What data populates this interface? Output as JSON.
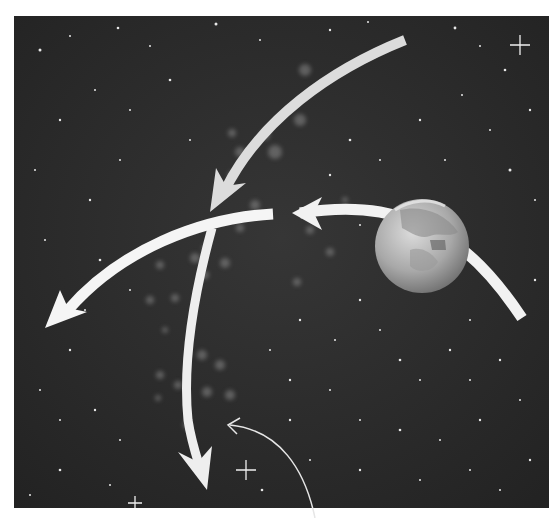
{
  "figure": {
    "colors": {
      "background_page": "#ffffff",
      "space": "#2a2a2a",
      "arrow": "#f2f2f2",
      "earth_light": "#cfcfcf",
      "earth_dark": "#7a7a7a",
      "callout_line": "#e6e6e6"
    },
    "panel": {
      "x": 14,
      "y": 16,
      "width": 535,
      "height": 492
    },
    "earth": {
      "cx": 422,
      "cy": 246,
      "r": 47
    },
    "arrows": [
      {
        "name": "earth-arrow",
        "from": [
          522,
          318
        ],
        "to": [
          292,
          213
        ]
      },
      {
        "name": "top-arrow",
        "from": [
          405,
          40
        ],
        "to": [
          210,
          210
        ]
      },
      {
        "name": "left-arrow",
        "from": [
          273,
          214
        ],
        "to": [
          45,
          328
        ]
      },
      {
        "name": "down-arrow",
        "from": [
          212,
          228
        ],
        "to": [
          207,
          490
        ]
      }
    ],
    "callout": {
      "from": [
        315,
        518
      ],
      "to": [
        228,
        425
      ]
    },
    "sparkles": [
      {
        "x": 520,
        "y": 45
      },
      {
        "x": 246,
        "y": 470
      },
      {
        "x": 135,
        "y": 503
      }
    ]
  }
}
